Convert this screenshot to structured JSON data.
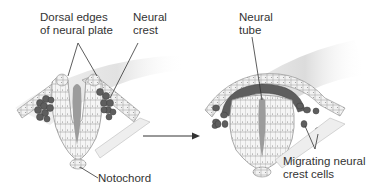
{
  "diagram": {
    "left_panel": {
      "labels": {
        "dorsal_edges": "Dorsal edges\nof neural plate",
        "neural_crest": "Neural\ncrest",
        "notochord": "Notochord"
      }
    },
    "right_panel": {
      "labels": {
        "neural_tube": "Neural\ntube",
        "migrating": "Migrating neural\ncrest cells"
      }
    },
    "arrow": {
      "direction": "right"
    },
    "colors": {
      "background": "#ffffff",
      "ectoderm_fill": "#e8e8e8",
      "cell_outline": "#8a8a8a",
      "neural_crest": "#5e5e5e",
      "lumen": "#9a9a9a",
      "text": "#333333"
    }
  }
}
